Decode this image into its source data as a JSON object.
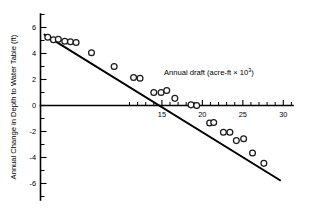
{
  "chart_data": {
    "type": "scatter",
    "title": "",
    "xlabel": "Annual draft (acre-ft × 10³)",
    "xlabel_main": "Annual draft (acre-ft × 10",
    "xlabel_exponent": "3",
    "xlabel_tail": ")",
    "ylabel": "Annual Change in Depth to Water Table (ft)",
    "xlim": [
      0,
      31.2
    ],
    "ylim": [
      -7.6,
      7.0
    ],
    "grid": false,
    "legend": null,
    "x_major_ticks": [
      15,
      20,
      25,
      30
    ],
    "x_major_tick_labels": [
      "15",
      "20",
      "25",
      "30"
    ],
    "x_minor_ticks": [
      11,
      12,
      13,
      14,
      16,
      17,
      18,
      19,
      21,
      22,
      23,
      24,
      26,
      27,
      28,
      29,
      31
    ],
    "y_major_ticks": [
      6,
      4,
      2,
      0,
      -2,
      -4,
      -6
    ],
    "y_major_tick_labels": [
      "6",
      "4",
      "2",
      "0",
      "-2",
      "-4",
      "-6"
    ],
    "y_minor_ticks": [
      7,
      5,
      3,
      1,
      -1,
      -3,
      -5,
      -7
    ],
    "marker_style": "open-circle",
    "series": [
      {
        "name": "observations",
        "points": [
          [
            0.9,
            5.25
          ],
          [
            1.6,
            5.05
          ],
          [
            2.2,
            5.1
          ],
          [
            3.0,
            4.95
          ],
          [
            3.7,
            4.9
          ],
          [
            4.4,
            4.85
          ],
          [
            6.3,
            4.05
          ],
          [
            9.1,
            3.0
          ],
          [
            11.5,
            2.15
          ],
          [
            12.3,
            2.1
          ],
          [
            14.0,
            1.0
          ],
          [
            14.9,
            1.0
          ],
          [
            15.6,
            1.15
          ],
          [
            16.6,
            0.55
          ],
          [
            18.6,
            0.05
          ],
          [
            19.3,
            0.0
          ],
          [
            20.9,
            -1.35
          ],
          [
            21.4,
            -1.3
          ],
          [
            22.6,
            -2.05
          ],
          [
            23.4,
            -2.05
          ],
          [
            24.2,
            -2.7
          ],
          [
            25.1,
            -2.55
          ],
          [
            26.2,
            -3.65
          ],
          [
            27.6,
            -4.45
          ]
        ]
      }
    ],
    "trend_line": {
      "name": "fitted regression line",
      "x_start": 0.5,
      "y_start": 5.45,
      "x_end": 29.6,
      "y_end": -5.75,
      "x_intercept": 19.0,
      "slope": -0.385,
      "intercept": 5.64
    }
  }
}
